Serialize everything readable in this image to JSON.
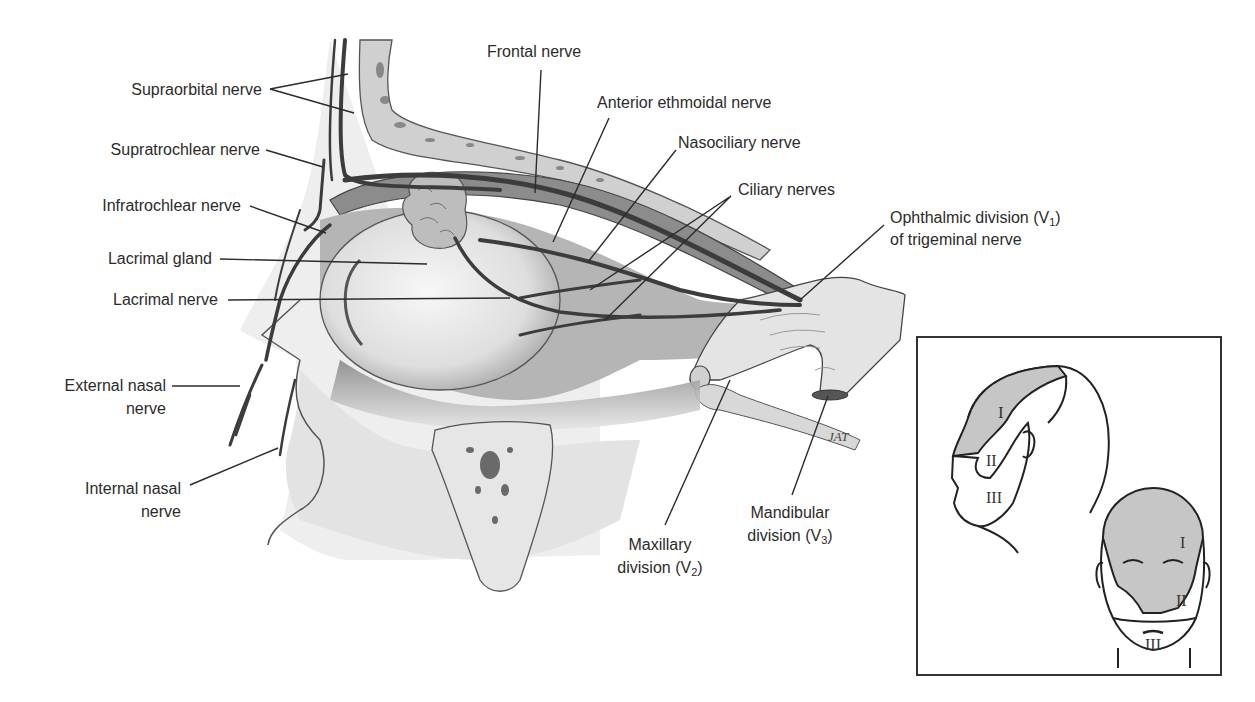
{
  "figure": {
    "colors": {
      "background": "#ffffff",
      "line": "#2b2b2b",
      "tissue": "#c8c8c8",
      "nerve": "#4a4a4a",
      "shade": "#cfcfcf"
    }
  },
  "labels": {
    "supraorbital": "Supraorbital nerve",
    "supratrochlear": "Supratrochlear nerve",
    "infratrochlear": "Infratrochlear nerve",
    "lacrimal_gland": "Lacrimal gland",
    "lacrimal_nerve": "Lacrimal nerve",
    "external_nasal_1": "External nasal",
    "external_nasal_2": "nerve",
    "internal_nasal_1": "Internal nasal",
    "internal_nasal_2": "nerve",
    "frontal": "Frontal nerve",
    "anterior_ethmoidal": "Anterior ethmoidal nerve",
    "nasociliary": "Nasociliary nerve",
    "ciliary": "Ciliary nerves",
    "ophthalmic_1": "Ophthalmic division (V",
    "ophthalmic_sub": "1",
    "ophthalmic_close": ")",
    "ophthalmic_2": "of trigeminal nerve",
    "maxillary_1": "Maxillary",
    "maxillary_2": "division (V",
    "maxillary_sub": "2",
    "maxillary_close": ")",
    "mandibular_1": "Mandibular",
    "mandibular_2": "division (V",
    "mandibular_sub": "3",
    "mandibular_close": ")",
    "artist_signature": "JAT"
  },
  "inset": {
    "profile_regions": [
      "I",
      "II",
      "III"
    ],
    "frontal_regions": [
      "I",
      "II",
      "III"
    ]
  }
}
